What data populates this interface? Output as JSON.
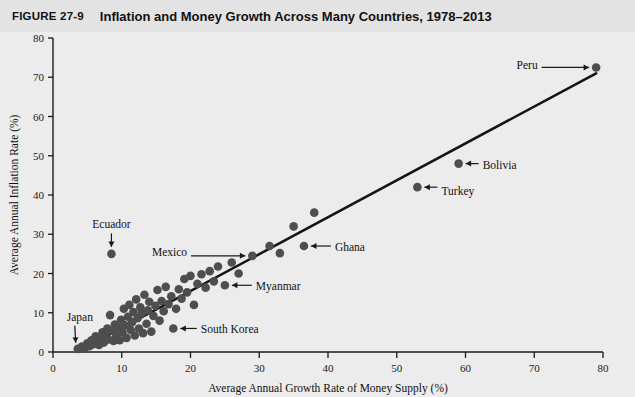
{
  "figure": {
    "number": "FIGURE 27-9",
    "title": "Inflation and Money Growth Across Many Countries, 1978–2013"
  },
  "colors": {
    "background": "#ececec",
    "title_band": "#e3e3e3",
    "dot": "#4e4e4e",
    "trend_line": "#141414",
    "axis": "#1a1a1a"
  },
  "chart_data": {
    "type": "scatter",
    "title": "Inflation and Money Growth Across Many Countries, 1978–2013",
    "xlabel": "Average Annual Growth Rate of Money Supply (%)",
    "ylabel": "Average Annual Inflation Rate (%)",
    "xlim": [
      0,
      80
    ],
    "ylim": [
      0,
      80
    ],
    "xticks": [
      0,
      10,
      20,
      30,
      40,
      50,
      60,
      70,
      80
    ],
    "yticks": [
      0,
      10,
      20,
      30,
      40,
      50,
      60,
      70,
      80
    ],
    "grid": false,
    "legend": "none",
    "trend_line": {
      "x": [
        4.0,
        79.0
      ],
      "y": [
        0.5,
        71.0
      ],
      "description": "Upward sloping fitted line from origin region to Peru"
    },
    "points": [
      {
        "x": 3.6,
        "y": 0.8,
        "label": "Japan"
      },
      {
        "x": 4.2,
        "y": 1.4,
        "label": ""
      },
      {
        "x": 4.6,
        "y": 1.0,
        "label": ""
      },
      {
        "x": 5.0,
        "y": 2.2,
        "label": ""
      },
      {
        "x": 5.3,
        "y": 1.5,
        "label": ""
      },
      {
        "x": 5.6,
        "y": 3.0,
        "label": ""
      },
      {
        "x": 5.9,
        "y": 2.0,
        "label": ""
      },
      {
        "x": 6.2,
        "y": 4.0,
        "label": ""
      },
      {
        "x": 6.4,
        "y": 2.6,
        "label": ""
      },
      {
        "x": 6.7,
        "y": 1.8,
        "label": ""
      },
      {
        "x": 7.0,
        "y": 3.4,
        "label": ""
      },
      {
        "x": 7.2,
        "y": 5.0,
        "label": ""
      },
      {
        "x": 7.4,
        "y": 2.4,
        "label": ""
      },
      {
        "x": 7.6,
        "y": 4.4,
        "label": ""
      },
      {
        "x": 7.9,
        "y": 6.0,
        "label": ""
      },
      {
        "x": 8.1,
        "y": 3.2,
        "label": ""
      },
      {
        "x": 8.3,
        "y": 9.4,
        "label": ""
      },
      {
        "x": 8.5,
        "y": 25.0,
        "label": "Ecuador"
      },
      {
        "x": 8.6,
        "y": 5.4,
        "label": ""
      },
      {
        "x": 8.8,
        "y": 2.8,
        "label": ""
      },
      {
        "x": 9.0,
        "y": 7.0,
        "label": ""
      },
      {
        "x": 9.2,
        "y": 4.0,
        "label": ""
      },
      {
        "x": 9.5,
        "y": 6.2,
        "label": ""
      },
      {
        "x": 9.7,
        "y": 3.0,
        "label": ""
      },
      {
        "x": 9.9,
        "y": 8.2,
        "label": ""
      },
      {
        "x": 10.1,
        "y": 5.0,
        "label": ""
      },
      {
        "x": 10.3,
        "y": 11.0,
        "label": ""
      },
      {
        "x": 10.5,
        "y": 6.8,
        "label": ""
      },
      {
        "x": 10.7,
        "y": 3.6,
        "label": ""
      },
      {
        "x": 10.9,
        "y": 9.0,
        "label": ""
      },
      {
        "x": 11.1,
        "y": 12.0,
        "label": ""
      },
      {
        "x": 11.3,
        "y": 5.6,
        "label": ""
      },
      {
        "x": 11.5,
        "y": 7.6,
        "label": ""
      },
      {
        "x": 11.7,
        "y": 10.2,
        "label": ""
      },
      {
        "x": 11.9,
        "y": 4.2,
        "label": ""
      },
      {
        "x": 12.1,
        "y": 13.4,
        "label": ""
      },
      {
        "x": 12.3,
        "y": 8.6,
        "label": ""
      },
      {
        "x": 12.5,
        "y": 6.0,
        "label": ""
      },
      {
        "x": 12.7,
        "y": 11.4,
        "label": ""
      },
      {
        "x": 12.9,
        "y": 9.8,
        "label": ""
      },
      {
        "x": 13.1,
        "y": 4.8,
        "label": ""
      },
      {
        "x": 13.3,
        "y": 14.6,
        "label": ""
      },
      {
        "x": 13.6,
        "y": 7.2,
        "label": ""
      },
      {
        "x": 13.8,
        "y": 10.6,
        "label": ""
      },
      {
        "x": 14.0,
        "y": 12.8,
        "label": ""
      },
      {
        "x": 14.3,
        "y": 5.2,
        "label": ""
      },
      {
        "x": 14.6,
        "y": 9.2,
        "label": ""
      },
      {
        "x": 14.9,
        "y": 11.8,
        "label": ""
      },
      {
        "x": 15.2,
        "y": 15.8,
        "label": ""
      },
      {
        "x": 15.5,
        "y": 8.0,
        "label": ""
      },
      {
        "x": 15.8,
        "y": 13.0,
        "label": ""
      },
      {
        "x": 16.1,
        "y": 10.4,
        "label": ""
      },
      {
        "x": 16.4,
        "y": 16.6,
        "label": ""
      },
      {
        "x": 16.8,
        "y": 12.2,
        "label": ""
      },
      {
        "x": 17.2,
        "y": 14.2,
        "label": ""
      },
      {
        "x": 17.5,
        "y": 6.0,
        "label": "South Korea"
      },
      {
        "x": 17.9,
        "y": 11.0,
        "label": ""
      },
      {
        "x": 18.3,
        "y": 16.0,
        "label": ""
      },
      {
        "x": 18.7,
        "y": 13.6,
        "label": ""
      },
      {
        "x": 19.1,
        "y": 18.6,
        "label": ""
      },
      {
        "x": 19.5,
        "y": 15.2,
        "label": ""
      },
      {
        "x": 20.0,
        "y": 19.4,
        "label": ""
      },
      {
        "x": 20.5,
        "y": 12.0,
        "label": ""
      },
      {
        "x": 21.0,
        "y": 17.4,
        "label": ""
      },
      {
        "x": 21.6,
        "y": 19.8,
        "label": ""
      },
      {
        "x": 22.2,
        "y": 16.4,
        "label": ""
      },
      {
        "x": 22.8,
        "y": 20.6,
        "label": ""
      },
      {
        "x": 23.4,
        "y": 18.0,
        "label": ""
      },
      {
        "x": 24.0,
        "y": 21.8,
        "label": ""
      },
      {
        "x": 25.0,
        "y": 17.0,
        "label": "Myanmar"
      },
      {
        "x": 26.0,
        "y": 22.8,
        "label": ""
      },
      {
        "x": 27.0,
        "y": 20.0,
        "label": ""
      },
      {
        "x": 29.0,
        "y": 24.5,
        "label": "Mexico"
      },
      {
        "x": 31.5,
        "y": 27.0,
        "label": ""
      },
      {
        "x": 33.0,
        "y": 25.2,
        "label": ""
      },
      {
        "x": 35.0,
        "y": 32.0,
        "label": ""
      },
      {
        "x": 36.5,
        "y": 27.0,
        "label": "Ghana"
      },
      {
        "x": 38.0,
        "y": 35.5,
        "label": ""
      },
      {
        "x": 53.0,
        "y": 42.0,
        "label": "Turkey"
      },
      {
        "x": 59.0,
        "y": 48.0,
        "label": "Bolivia"
      },
      {
        "x": 79.0,
        "y": 72.5,
        "label": "Peru"
      }
    ],
    "annotations": [
      {
        "label": "Peru",
        "point": [
          79.0,
          72.5
        ],
        "text_pos": [
          70.5,
          73.2
        ],
        "arrow": "right"
      },
      {
        "label": "Bolivia",
        "point": [
          59.0,
          48.0
        ],
        "text_pos": [
          62.5,
          47.6
        ],
        "arrow": "left"
      },
      {
        "label": "Turkey",
        "point": [
          53.0,
          42.0
        ],
        "text_pos": [
          56.5,
          41.0
        ],
        "arrow": "left"
      },
      {
        "label": "Ghana",
        "point": [
          36.5,
          27.0
        ],
        "text_pos": [
          41.0,
          26.8
        ],
        "arrow": "left"
      },
      {
        "label": "Mexico",
        "point": [
          29.0,
          24.5
        ],
        "text_pos": [
          19.5,
          25.4
        ],
        "arrow": "right"
      },
      {
        "label": "Myanmar",
        "point": [
          25.0,
          17.0
        ],
        "text_pos": [
          29.5,
          16.8
        ],
        "arrow": "left"
      },
      {
        "label": "South Korea",
        "point": [
          17.5,
          6.0
        ],
        "text_pos": [
          21.5,
          5.8
        ],
        "arrow": "left"
      },
      {
        "label": "Ecuador",
        "point": [
          8.5,
          25.0
        ],
        "text_pos": [
          8.5,
          31.5
        ],
        "arrow": "down"
      },
      {
        "label": "Japan",
        "point": [
          3.6,
          0.8
        ],
        "text_pos": [
          2.0,
          8.0
        ],
        "arrow": "down-left"
      }
    ]
  }
}
